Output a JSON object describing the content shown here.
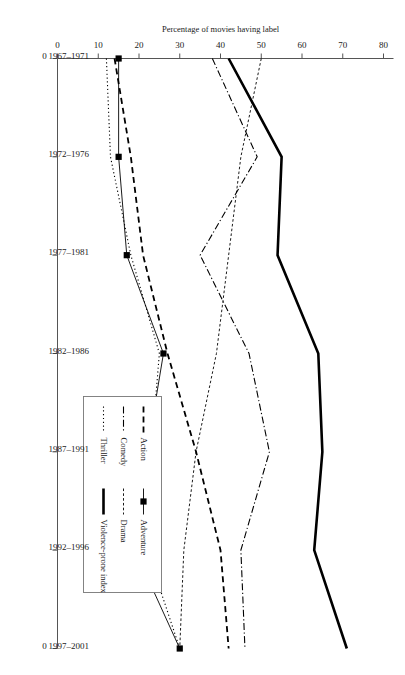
{
  "chart_data": {
    "type": "line",
    "title": "",
    "xlabel": "",
    "ylabel": "Percentage of movies having label",
    "orientation": "rotated-90-clockwise",
    "grid": false,
    "legend_position": "inside-right",
    "ylim": [
      0,
      80
    ],
    "yticks": [
      0,
      10,
      20,
      30,
      40,
      50,
      60,
      70,
      80
    ],
    "categories": [
      "1967–1971",
      "1972–1976",
      "1977–1981",
      "1982–1986",
      "1987–1991",
      "1992–1996",
      "1997–2001"
    ],
    "axis_end_label": "0",
    "series": [
      {
        "name": "Action",
        "style": "dashed",
        "values": [
          14,
          18,
          21,
          27,
          34,
          40,
          42
        ]
      },
      {
        "name": "Comedy",
        "style": "dash-dot",
        "values": [
          38,
          49,
          35,
          47,
          52,
          45,
          46
        ]
      },
      {
        "name": "Thriller",
        "style": "dotted",
        "values": [
          12,
          13,
          18,
          25,
          23,
          22,
          30
        ]
      },
      {
        "name": "Adventure",
        "style": "solid-marker",
        "values": [
          15,
          15,
          17,
          26,
          22,
          19,
          30
        ]
      },
      {
        "name": "Drama",
        "style": "fine-dashed",
        "values": [
          50,
          45,
          42,
          39,
          34,
          31,
          30
        ]
      },
      {
        "name": "Violence-prone index",
        "style": "thick-solid",
        "values": [
          42,
          55,
          54,
          64,
          65,
          63,
          71
        ]
      }
    ]
  },
  "axes": {
    "y_title": "Percentage of movies having label",
    "y_tick_labels": [
      "80",
      "70",
      "60",
      "50",
      "40",
      "30",
      "20",
      "10",
      "0"
    ],
    "x_tick_labels": [
      "1967–1971",
      "1972–1976",
      "1977–1981",
      "1982–1986",
      "1987–1991",
      "1992–1996",
      "1997–2001"
    ],
    "origin_label_top": "0",
    "origin_label_bottom": "0"
  },
  "legend": {
    "column_1": [
      {
        "label": "Action",
        "style": "dashed"
      },
      {
        "label": "Comedy",
        "style": "dash-dot"
      },
      {
        "label": "Thriller",
        "style": "dotted"
      }
    ],
    "column_2": [
      {
        "label": "Adventure",
        "style": "solid-marker"
      },
      {
        "label": "Drama",
        "style": "fine-dashed"
      },
      {
        "label": "Violence-prone index",
        "style": "thick-solid"
      }
    ]
  },
  "colors": {
    "ink": "#000000",
    "axis": "#555555",
    "background": "#ffffff",
    "legend_border": "#777777"
  }
}
